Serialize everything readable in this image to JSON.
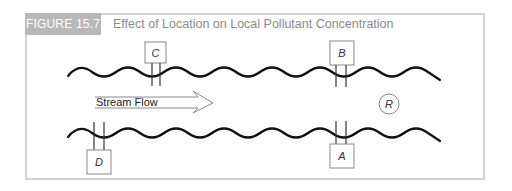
{
  "figure": {
    "label": "FIGURE 15.7",
    "title": "Effect of Location on Local Pollutant Concentration",
    "colors": {
      "label_bg": "#b8b8b8",
      "label_text": "#ffffff",
      "title_text": "#8a8a8a",
      "frame_border": "#d4d4d4",
      "stream_line": "#111111",
      "shape_stroke": "#888888"
    }
  },
  "diagram": {
    "stream_label": "Stream Flow",
    "flow_direction": "left-to-right",
    "sensors": [
      {
        "id": "C",
        "label": "C",
        "bank": "upper"
      },
      {
        "id": "B",
        "label": "B",
        "bank": "upper"
      },
      {
        "id": "D",
        "label": "D",
        "bank": "lower"
      },
      {
        "id": "A",
        "label": "A",
        "bank": "lower"
      }
    ],
    "receptor": {
      "id": "R",
      "label": "R",
      "shape": "circle"
    }
  }
}
